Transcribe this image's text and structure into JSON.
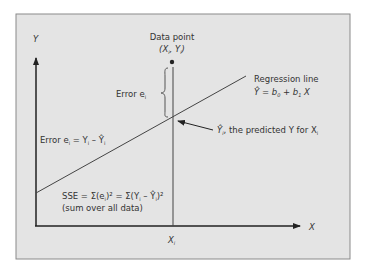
{
  "colors": {
    "background": "#ffffff",
    "panel_fill": "#e4e4e4",
    "panel_border": "#8a8a8a",
    "ink": "#333333"
  },
  "axes": {
    "y_label": "Y",
    "x_label": "X",
    "x_tick_label": "X",
    "x_tick_sub": "i"
  },
  "data_point": {
    "title": "Data point",
    "coords_open": "(X",
    "coords_sub1": "i",
    "coords_mid": ", Y",
    "coords_sub2": "i",
    "coords_close": ")"
  },
  "error_brace_label": {
    "text": "Error e",
    "sub": "i"
  },
  "regression": {
    "title": "Regression line",
    "eq_yhat": "Ŷ",
    "eq_rest1": " = b",
    "eq_sub0": "0",
    "eq_rest2": " + b",
    "eq_sub1": "1",
    "eq_rest3": " X"
  },
  "predicted": {
    "yhat": "Ŷ",
    "sub": "i",
    "text": ", the predicted Y for X",
    "sub2": "i"
  },
  "error_formula": {
    "prefix": "Error e",
    "sub1": "i",
    "eq": " = Y",
    "sub2": "i",
    "minus": " – Ŷ",
    "sub3": "i"
  },
  "sse": {
    "line1_a": "SSE = Σ(e",
    "line1_sub1": "i",
    "line1_b": ")² = Σ(Y",
    "line1_sub2": "i",
    "line1_c": " – Ŷ",
    "line1_sub3": "i",
    "line1_d": ")²",
    "line2": "(sum over all data)"
  }
}
